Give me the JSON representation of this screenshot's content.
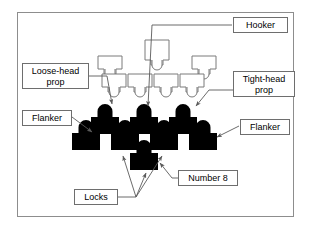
{
  "diagram": {
    "frame": {
      "stroke": "#8d8d8d"
    },
    "colors": {
      "own_team_fill": "#000000",
      "opposing_team_fill": "#ffffff",
      "opposing_team_stroke": "#7a7a7a",
      "label_border": "#6e6e6e",
      "leader_line": "#5a5a5a",
      "background": "#ffffff"
    },
    "labels": [
      {
        "id": "hooker",
        "text": "Hooker",
        "x": 233,
        "y": 17,
        "w": 55,
        "h": 16
      },
      {
        "id": "loose-head-prop",
        "text": "Loose-head\nprop",
        "x": 22,
        "y": 63,
        "w": 67,
        "h": 26
      },
      {
        "id": "tight-head-prop",
        "text": "Tight-head\nprop",
        "x": 233,
        "y": 71,
        "w": 62,
        "h": 26
      },
      {
        "id": "flanker-left",
        "text": "Flanker",
        "x": 22,
        "y": 110,
        "w": 50,
        "h": 16
      },
      {
        "id": "flanker-right",
        "text": "Flanker",
        "x": 240,
        "y": 119,
        "w": 50,
        "h": 16
      },
      {
        "id": "number-8",
        "text": "Number 8",
        "x": 178,
        "y": 170,
        "w": 60,
        "h": 16
      },
      {
        "id": "locks",
        "text": "Locks",
        "x": 74,
        "y": 189,
        "w": 44,
        "h": 16
      }
    ],
    "own_team_players": [
      {
        "id": "loose-head-prop-figure",
        "row": "front",
        "x": 91,
        "y": 104
      },
      {
        "id": "hooker-figure",
        "row": "front",
        "x": 130,
        "y": 104
      },
      {
        "id": "tight-head-prop-figure",
        "row": "front",
        "x": 169,
        "y": 104
      },
      {
        "id": "flanker-left-figure",
        "row": "second",
        "x": 72,
        "y": 120
      },
      {
        "id": "lock-left-figure",
        "row": "second",
        "x": 111,
        "y": 120
      },
      {
        "id": "lock-right-figure",
        "row": "second",
        "x": 150,
        "y": 120
      },
      {
        "id": "flanker-right-figure",
        "row": "second",
        "x": 189,
        "y": 120
      },
      {
        "id": "number-8-figure",
        "row": "back",
        "x": 130,
        "y": 140
      }
    ],
    "opposing_team_players": [
      {
        "id": "opponent-back-left",
        "row": "back",
        "x": 96,
        "y": 56
      },
      {
        "id": "opponent-back-centre",
        "row": "back",
        "x": 143,
        "y": 40
      },
      {
        "id": "opponent-back-right",
        "row": "back",
        "x": 190,
        "y": 56
      },
      {
        "id": "opponent-front-1",
        "row": "front",
        "x": 100,
        "y": 74
      },
      {
        "id": "opponent-front-2",
        "row": "front",
        "x": 126,
        "y": 74
      },
      {
        "id": "opponent-front-3",
        "row": "front",
        "x": 152,
        "y": 74
      },
      {
        "id": "opponent-front-4",
        "row": "front",
        "x": 178,
        "y": 74
      }
    ],
    "leader_lines": [
      {
        "id": "hooker-leader",
        "from": "hooker",
        "to": "hooker-figure"
      },
      {
        "id": "loose-head-prop-leader",
        "from": "loose-head-prop",
        "to": "loose-head-prop-figure"
      },
      {
        "id": "tight-head-prop-leader",
        "from": "tight-head-prop",
        "to": "tight-head-prop-figure"
      },
      {
        "id": "flanker-left-leader",
        "from": "flanker-left",
        "to": "flanker-left-figure"
      },
      {
        "id": "flanker-right-leader",
        "from": "flanker-right",
        "to": "flanker-right-figure"
      },
      {
        "id": "number-8-leader",
        "from": "number-8",
        "to": "number-8-figure"
      },
      {
        "id": "locks-leader-left",
        "from": "locks",
        "to": "lock-left-figure"
      },
      {
        "id": "locks-leader-right",
        "from": "locks",
        "to": "lock-right-figure"
      },
      {
        "id": "locks-leader-centre",
        "from": "locks",
        "to": "number-8-figure"
      }
    ]
  }
}
